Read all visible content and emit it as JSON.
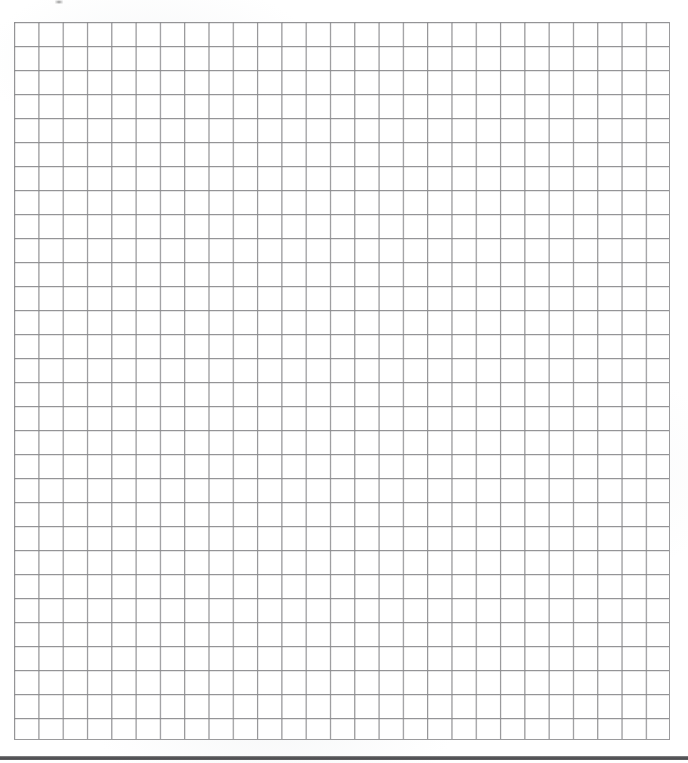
{
  "page": {
    "kind": "blank-ruled-grid-worksheet",
    "width": 688,
    "height": 763,
    "background_color": "#ffffff",
    "text_content": ""
  },
  "grid": {
    "name": "graph-paper-grid",
    "columns": 27,
    "rows": 30,
    "cell_width": 24.3,
    "cell_height": 24.0,
    "left": 14,
    "top": 22,
    "width": 656,
    "height": 718,
    "line_color": "#9a9a9c",
    "cell_fill_color": "#ffffff",
    "has_labels": false,
    "has_data": false
  },
  "footer_rule": {
    "name": "footer-divider",
    "top": 756,
    "height": 4,
    "color": "#57575a"
  },
  "artifacts": {
    "scan_speck": {
      "name": "scan-speck",
      "left": 55,
      "top": 0,
      "width": 8,
      "height": 4,
      "color": "#3c3c3c"
    }
  }
}
